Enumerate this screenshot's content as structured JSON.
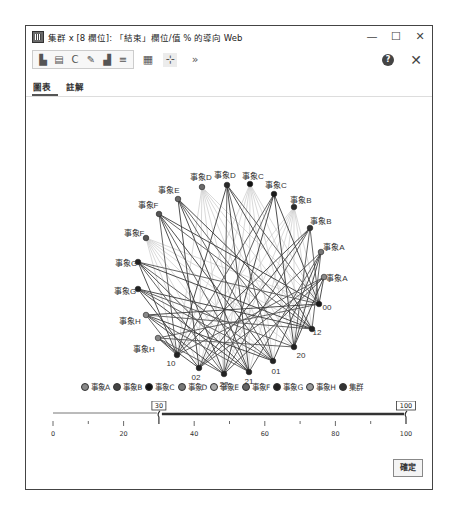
{
  "window": {
    "title": "集群 x [8 欄位]: 「結束」欄位/值 % 的導向 Web",
    "minimize_label": "—",
    "maximize_label": "☐",
    "close_label": "✕"
  },
  "toolbar": {
    "group_icons": [
      "clipboard-icon",
      "document-icon",
      "refresh-icon",
      "brush-icon",
      "stamp-icon",
      "menu-lines-icon"
    ],
    "group_glyphs": [
      "▙",
      "▤",
      "C",
      "✎",
      "▟",
      "≡"
    ],
    "extra_icons": [
      {
        "name": "chart-image-icon",
        "glyph": "▦"
      },
      {
        "name": "network-tool-icon",
        "glyph": "⊹"
      },
      {
        "name": "more-icon",
        "glyph": "»"
      }
    ],
    "help_label": "?",
    "close_label": "✕"
  },
  "tabs": [
    {
      "label": "圖表",
      "active": true
    },
    {
      "label": "註解",
      "active": false
    }
  ],
  "chart_data": {
    "type": "network",
    "title": "導向 Web",
    "nodes": [
      {
        "id": "n1",
        "label": "事象D",
        "x": 201,
        "y": 138,
        "lx": 200,
        "ly": 128,
        "color": "#6b6b6b"
      },
      {
        "id": "n2",
        "label": "事象D",
        "x": 226,
        "y": 136,
        "lx": 224,
        "ly": 126,
        "color": "#2a2a2a"
      },
      {
        "id": "n3",
        "label": "事象C",
        "x": 249,
        "y": 135,
        "lx": 252,
        "ly": 127,
        "color": "#111111"
      },
      {
        "id": "n4",
        "label": "事象C",
        "x": 273,
        "y": 145,
        "lx": 275,
        "ly": 136,
        "color": "#1a1a1a"
      },
      {
        "id": "n5",
        "label": "事象E",
        "x": 177,
        "y": 150,
        "lx": 168,
        "ly": 141,
        "color": "#6b6b6b"
      },
      {
        "id": "n6",
        "label": "事象B",
        "x": 293,
        "y": 158,
        "lx": 300,
        "ly": 151,
        "color": "#2a2a2a"
      },
      {
        "id": "n7",
        "label": "事象F",
        "x": 158,
        "y": 165,
        "lx": 147,
        "ly": 156,
        "color": "#555555"
      },
      {
        "id": "n8",
        "label": "事象B",
        "x": 309,
        "y": 179,
        "lx": 320,
        "ly": 172,
        "color": "#333333"
      },
      {
        "id": "n9",
        "label": "事象F",
        "x": 145,
        "y": 189,
        "lx": 133,
        "ly": 184,
        "color": "#555555"
      },
      {
        "id": "n10",
        "label": "事象A",
        "x": 320,
        "y": 203,
        "lx": 333,
        "ly": 198,
        "color": "#777777"
      },
      {
        "id": "n11",
        "label": "事象G",
        "x": 137,
        "y": 213,
        "lx": 125,
        "ly": 214,
        "color": "#222222"
      },
      {
        "id": "n12",
        "label": "事象A",
        "x": 323,
        "y": 228,
        "lx": 336,
        "ly": 229,
        "color": "#888888"
      },
      {
        "id": "n13",
        "label": "事象G",
        "x": 137,
        "y": 240,
        "lx": 124,
        "ly": 242,
        "color": "#222222"
      },
      {
        "id": "n14",
        "label": "00",
        "x": 318,
        "y": 255,
        "lx": 326,
        "ly": 258,
        "color": "#1a1a1a"
      },
      {
        "id": "n15",
        "label": "事象H",
        "x": 145,
        "y": 266,
        "lx": 129,
        "ly": 272,
        "color": "#888888"
      },
      {
        "id": "n16",
        "label": "12",
        "x": 311,
        "y": 280,
        "lx": 316,
        "ly": 283,
        "color": "#222222"
      },
      {
        "id": "n17",
        "label": "事象H",
        "x": 157,
        "y": 289,
        "lx": 143,
        "ly": 300,
        "color": "#888888"
      },
      {
        "id": "n18",
        "label": "20",
        "x": 293,
        "y": 298,
        "lx": 300,
        "ly": 306,
        "color": "#222222"
      },
      {
        "id": "n19",
        "label": "10",
        "x": 176,
        "y": 306,
        "lx": 170,
        "ly": 314,
        "color": "#222222"
      },
      {
        "id": "n20",
        "label": "01",
        "x": 272,
        "y": 312,
        "lx": 275,
        "ly": 322,
        "color": "#222222"
      },
      {
        "id": "n21",
        "label": "02",
        "x": 198,
        "y": 319,
        "lx": 195,
        "ly": 328,
        "color": "#222222"
      },
      {
        "id": "n22",
        "label": "22",
        "x": 223,
        "y": 325,
        "lx": 223,
        "ly": 335,
        "color": "#222222"
      },
      {
        "id": "n23",
        "label": "21",
        "x": 248,
        "y": 323,
        "lx": 248,
        "ly": 332,
        "color": "#222222"
      }
    ],
    "edges_from": [
      "n2",
      "n4",
      "n5",
      "n7",
      "n8",
      "n10",
      "n11",
      "n12",
      "n13",
      "n15",
      "n17"
    ],
    "edges_to": [
      "n14",
      "n16",
      "n18",
      "n19",
      "n20",
      "n21",
      "n22",
      "n23"
    ],
    "faint_edges_from": [
      "n1",
      "n3",
      "n6",
      "n9"
    ],
    "legend": [
      {
        "label": "事象A",
        "color": "#888888"
      },
      {
        "label": "事象B",
        "color": "#444444"
      },
      {
        "label": "事象C",
        "color": "#111111"
      },
      {
        "label": "事象D",
        "color": "#777777"
      },
      {
        "label": "事象E",
        "color": "#aaaaaa"
      },
      {
        "label": "事象F",
        "color": "#666666"
      },
      {
        "label": "事象G",
        "color": "#222222"
      },
      {
        "label": "事象H",
        "color": "#999999"
      },
      {
        "label": "集群",
        "color": "#333333"
      }
    ],
    "slider": {
      "min": 0,
      "max": 100,
      "low": 30,
      "high": 100,
      "ticks": [
        "0",
        "20",
        "40",
        "60",
        "80",
        "100"
      ]
    }
  },
  "footer": {
    "ok_label": "確定"
  }
}
